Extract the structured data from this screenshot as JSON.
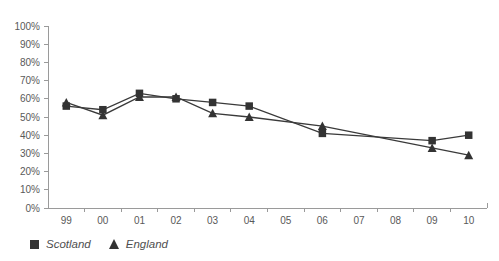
{
  "chart_data": {
    "type": "line",
    "title": "",
    "subtitle": "",
    "xlabel": "",
    "ylabel": "",
    "grid": false,
    "legend_position": "bottom-left",
    "categories": [
      "99",
      "00",
      "01",
      "02",
      "03",
      "04",
      "05",
      "06",
      "07",
      "08",
      "09",
      "10"
    ],
    "x_tick_labels": [
      "99",
      "00",
      "01",
      "02",
      "03",
      "04",
      "05",
      "06",
      "07",
      "08",
      "09",
      "10"
    ],
    "y_tick_labels": [
      "0%",
      "10%",
      "20%",
      "30%",
      "40%",
      "50%",
      "60%",
      "70%",
      "80%",
      "90%",
      "100%"
    ],
    "y_tick_values": [
      0,
      10,
      20,
      30,
      40,
      50,
      60,
      70,
      80,
      90,
      100
    ],
    "ylim": [
      0,
      100
    ],
    "series": [
      {
        "name": "Scotland",
        "marker": "square",
        "color": "#333333",
        "x": [
          "99",
          "00",
          "01",
          "02",
          "03",
          "04",
          "06",
          "09",
          "10"
        ],
        "values": [
          56,
          54,
          63,
          60,
          58,
          56,
          41,
          37,
          40
        ]
      },
      {
        "name": "England",
        "marker": "triangle",
        "color": "#333333",
        "x": [
          "99",
          "00",
          "01",
          "02",
          "03",
          "04",
          "06",
          "09",
          "10"
        ],
        "values": [
          58,
          51,
          61,
          61,
          52,
          50,
          45,
          33,
          29
        ]
      }
    ]
  },
  "legend": {
    "items": [
      {
        "label": "Scotland",
        "marker": "square"
      },
      {
        "label": "England",
        "marker": "triangle"
      }
    ]
  }
}
